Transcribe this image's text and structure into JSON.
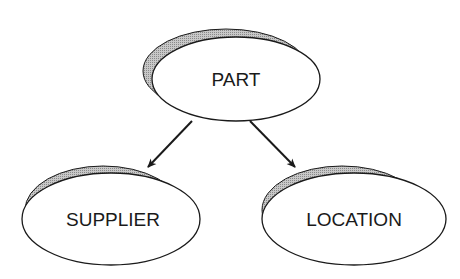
{
  "diagram": {
    "type": "hierarchy",
    "nodes": [
      {
        "id": "part",
        "label": "PART"
      },
      {
        "id": "supplier",
        "label": "SUPPLIER"
      },
      {
        "id": "location",
        "label": "LOCATION"
      }
    ],
    "edges": [
      {
        "from": "part",
        "to": "supplier"
      },
      {
        "from": "part",
        "to": "location"
      }
    ]
  },
  "colors": {
    "outline": "#1a1a1a",
    "shadow": "#b4b4b4",
    "fill": "#ffffff"
  }
}
